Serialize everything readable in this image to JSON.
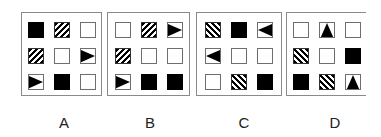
{
  "options": [
    {
      "label": "A",
      "cells": [
        [
          "black",
          "hatch-r",
          "empty"
        ],
        [
          "hatch-r",
          "empty",
          "triangle-right"
        ],
        [
          "triangle-right",
          "black",
          "empty"
        ]
      ]
    },
    {
      "label": "B",
      "cells": [
        [
          "empty",
          "hatch-r",
          "triangle-right"
        ],
        [
          "hatch-r",
          "empty",
          "empty"
        ],
        [
          "triangle-right",
          "black",
          "black"
        ]
      ]
    },
    {
      "label": "C",
      "cells": [
        [
          "hatch-l",
          "black",
          "triangle-left"
        ],
        [
          "triangle-left",
          "empty",
          "empty"
        ],
        [
          "empty",
          "hatch-l",
          "black"
        ]
      ]
    },
    {
      "label": "D",
      "cells": [
        [
          "empty",
          "triangle-up",
          "empty"
        ],
        [
          "hatch-l",
          "empty",
          "black"
        ],
        [
          "black",
          "hatch-l",
          "triangle-up"
        ]
      ]
    }
  ],
  "colors": {
    "fill": "#000000",
    "border": "#8a8a8a",
    "background": "#ffffff"
  }
}
